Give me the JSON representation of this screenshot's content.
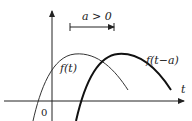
{
  "diagram": {
    "shift_label": "a > 0",
    "original_curve_label": "f(t)",
    "shifted_curve_label": "f(t−a)",
    "x_axis_label": "t",
    "origin_label": "0",
    "colors": {
      "ink": "#222222",
      "background": "#ffffff"
    }
  }
}
